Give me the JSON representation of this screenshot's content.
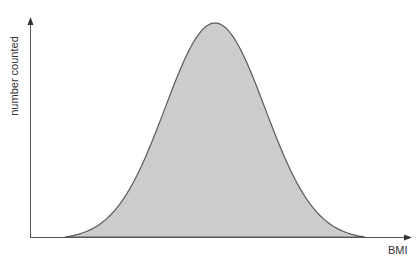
{
  "chart_data": {
    "type": "area",
    "title": "",
    "xlabel": "BMI",
    "ylabel": "number counted",
    "grid": false,
    "legend": null,
    "x_range_px": [
      30,
      412
    ],
    "y_range_px": [
      237,
      18
    ],
    "curve": {
      "start_x_px": 65,
      "peak_x_px": 215,
      "peak_y_px": 23,
      "end_x_px": 365,
      "sigma_px": 50
    },
    "colors": {
      "fill": "#cccccc",
      "stroke": "#5a5a5a",
      "axis": "#555555"
    }
  }
}
